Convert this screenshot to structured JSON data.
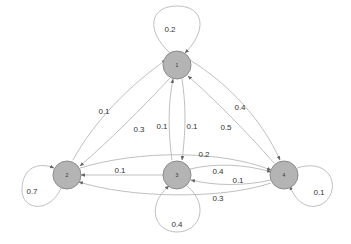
{
  "diagram": {
    "type": "markov-chain",
    "nodes": [
      {
        "id": "1",
        "label": "1"
      },
      {
        "id": "2",
        "label": "2"
      },
      {
        "id": "3",
        "label": "3"
      },
      {
        "id": "4",
        "label": "4"
      }
    ],
    "edges": [
      {
        "from": "1",
        "to": "1",
        "label": "0.2"
      },
      {
        "from": "2",
        "to": "1",
        "label": "0.1"
      },
      {
        "from": "1",
        "to": "2",
        "label": "0.3"
      },
      {
        "from": "3",
        "to": "1",
        "label": "0.1"
      },
      {
        "from": "1",
        "to": "3",
        "label": "0.1"
      },
      {
        "from": "4",
        "to": "1",
        "label": "0.5"
      },
      {
        "from": "1",
        "to": "4",
        "label": "0.4"
      },
      {
        "from": "2",
        "to": "2",
        "label": "0.7"
      },
      {
        "from": "2",
        "to": "4",
        "label": "0.2"
      },
      {
        "from": "3",
        "to": "2",
        "label": "0.1"
      },
      {
        "from": "3",
        "to": "4",
        "label": "0.4"
      },
      {
        "from": "4",
        "to": "3",
        "label": "0.1"
      },
      {
        "from": "4",
        "to": "2",
        "label": "0.3"
      },
      {
        "from": "3",
        "to": "3",
        "label": "0.4"
      },
      {
        "from": "4",
        "to": "4",
        "label": "0.1"
      }
    ]
  }
}
